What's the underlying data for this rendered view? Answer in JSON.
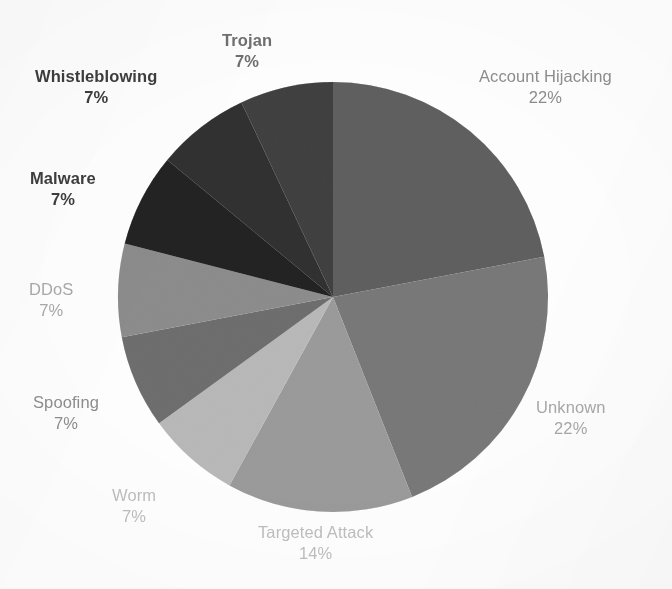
{
  "chart_data": {
    "type": "pie",
    "title": "",
    "subtitle": "",
    "xlabel": "",
    "ylabel": "",
    "legend_position": "none",
    "grid": false,
    "value_unit": "%",
    "label_format": "name + percent",
    "start_angle_deg": 0,
    "direction": "clockwise",
    "categories": [
      "Account Hijacking",
      "Unknown",
      "Targeted Attack",
      "Worm",
      "Spoofing",
      "DDoS",
      "Malware",
      "Whistleblowing",
      "Trojan"
    ],
    "values": [
      22,
      22,
      14,
      7,
      7,
      7,
      7,
      7,
      7
    ],
    "percent_labels": [
      "22%",
      "22%",
      "14%",
      "7%",
      "7%",
      "7%",
      "7%",
      "7%",
      "7%"
    ],
    "colors": [
      "#808080",
      "#989898",
      "#b5b5b5",
      "#cdcdcd",
      "#8e8e8e",
      "#a9a9a9",
      "#3a3a3a",
      "#4d4d4d",
      "#606060"
    ]
  },
  "slices": [
    {
      "name": "Account Hijacking",
      "percent_text": "22%",
      "value": 22,
      "color": "#808080",
      "label_tone": "tone-grey",
      "label_left": 479,
      "label_top": 66
    },
    {
      "name": "Unknown",
      "percent_text": "22%",
      "value": 22,
      "color": "#989898",
      "label_tone": "tone-light",
      "label_left": 536,
      "label_top": 397
    },
    {
      "name": "Targeted Attack",
      "percent_text": "14%",
      "value": 14,
      "color": "#b5b5b5",
      "label_tone": "tone-faint",
      "label_left": 258,
      "label_top": 522
    },
    {
      "name": "Worm",
      "percent_text": "7%",
      "value": 7,
      "color": "#cdcdcd",
      "label_tone": "tone-faint",
      "label_left": 112,
      "label_top": 485
    },
    {
      "name": "Spoofing",
      "percent_text": "7%",
      "value": 7,
      "color": "#8e8e8e",
      "label_tone": "tone-grey",
      "label_left": 33,
      "label_top": 392
    },
    {
      "name": "DDoS",
      "percent_text": "7%",
      "value": 7,
      "color": "#a9a9a9",
      "label_tone": "tone-light",
      "label_left": 29,
      "label_top": 279
    },
    {
      "name": "Malware",
      "percent_text": "7%",
      "value": 7,
      "color": "#3a3a3a",
      "label_tone": "tone-dark",
      "label_left": 30,
      "label_top": 168
    },
    {
      "name": "Whistleblowing",
      "percent_text": "7%",
      "value": 7,
      "color": "#4d4d4d",
      "label_tone": "tone-dark",
      "label_left": 35,
      "label_top": 66
    },
    {
      "name": "Trojan",
      "percent_text": "7%",
      "value": 7,
      "color": "#606060",
      "label_tone": "tone-mid",
      "label_left": 222,
      "label_top": 30
    }
  ],
  "geometry": {
    "center_x": 333,
    "center_y": 297,
    "radius": 215
  }
}
